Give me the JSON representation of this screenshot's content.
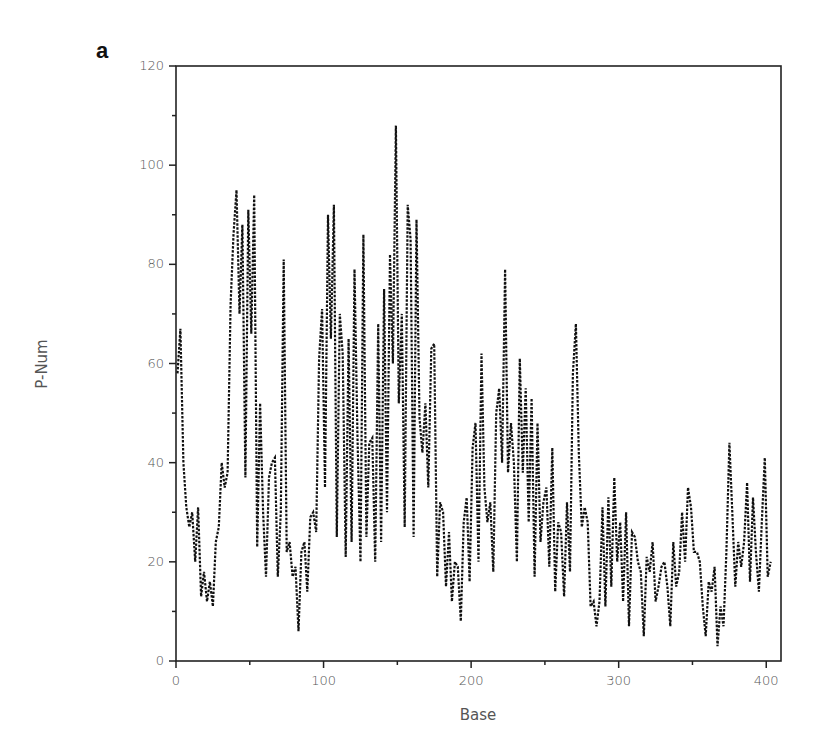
{
  "panel_label": "a",
  "chart_data": {
    "type": "line",
    "title": "",
    "panel": "a",
    "xlabel": "Base",
    "ylabel": "P-Num",
    "xlim": [
      0,
      410
    ],
    "ylim": [
      0,
      120
    ],
    "xticks": [
      0,
      100,
      200,
      300,
      400
    ],
    "yticks": [
      0,
      20,
      40,
      60,
      80,
      100,
      120
    ],
    "x_minor_step": 50,
    "y_minor_step": 10,
    "grid": false,
    "legend": null,
    "line_style": "dotted",
    "line_color": "#111111",
    "series": [
      {
        "name": "P-Num",
        "x_start": 1,
        "x_step": 2,
        "values": [
          58,
          67,
          40,
          31,
          27,
          30,
          20,
          31,
          13,
          18,
          12,
          16,
          11,
          24,
          27,
          40,
          35,
          38,
          72,
          86,
          95,
          70,
          88,
          37,
          91,
          66,
          94,
          23,
          52,
          30,
          17,
          37,
          40,
          41,
          17,
          30,
          81,
          22,
          24,
          17,
          19,
          6,
          22,
          24,
          14,
          29,
          30,
          26,
          61,
          71,
          35,
          90,
          65,
          92,
          25,
          70,
          62,
          21,
          65,
          24,
          79,
          45,
          20,
          86,
          25,
          44,
          45,
          20,
          68,
          24,
          75,
          30,
          82,
          60,
          108,
          52,
          70,
          27,
          92,
          85,
          25,
          89,
          49,
          42,
          52,
          35,
          63,
          64,
          17,
          32,
          30,
          15,
          26,
          12,
          20,
          19,
          8,
          28,
          33,
          16,
          43,
          48,
          20,
          62,
          35,
          28,
          32,
          18,
          50,
          55,
          40,
          79,
          38,
          48,
          40,
          20,
          61,
          38,
          55,
          28,
          53,
          17,
          48,
          24,
          32,
          35,
          19,
          43,
          14,
          28,
          26,
          13,
          32,
          18,
          58,
          68,
          42,
          27,
          31,
          28,
          11,
          12,
          7,
          12,
          31,
          11,
          33,
          15,
          37,
          20,
          28,
          12,
          30,
          7,
          26,
          25,
          20,
          18,
          5,
          21,
          18,
          24,
          12,
          15,
          19,
          20,
          15,
          7,
          24,
          15,
          18,
          30,
          20,
          35,
          31,
          22,
          22,
          20,
          11,
          5,
          16,
          14,
          19,
          3,
          11,
          7,
          22,
          44,
          30,
          15,
          24,
          19,
          24,
          36,
          16,
          33,
          22,
          14,
          28,
          41,
          17,
          20
        ]
      }
    ]
  },
  "plot_box": {
    "left": 176,
    "top": 66,
    "right": 781,
    "bottom": 661
  }
}
